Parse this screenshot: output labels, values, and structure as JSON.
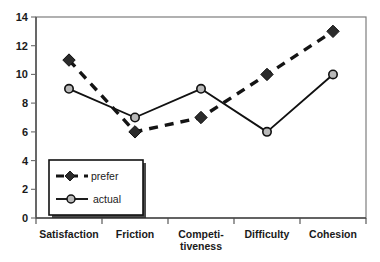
{
  "chart_data": {
    "type": "line",
    "title": "",
    "xlabel": "",
    "ylabel": "",
    "categories": [
      "Satisfaction",
      "Friction",
      "Competi-\ntiveness",
      "Difficulty",
      "Cohesion"
    ],
    "categories_flat": [
      "Satisfaction",
      "Friction",
      "Competitiveness",
      "Difficulty",
      "Cohesion"
    ],
    "series": [
      {
        "name": "prefer",
        "values": [
          11,
          6,
          7,
          10,
          13
        ],
        "style": "dashed",
        "marker": "diamond",
        "color": "#1a1a1a"
      },
      {
        "name": "actual",
        "values": [
          9,
          7,
          9,
          6,
          10
        ],
        "style": "solid",
        "marker": "circle",
        "color": "#1a1a1a"
      }
    ],
    "ylim": [
      0,
      14
    ],
    "yticks": [
      0,
      2,
      4,
      6,
      8,
      10,
      12,
      14
    ],
    "ytick_labels": [
      "0",
      "2",
      "4",
      "6",
      "8",
      "10",
      "12",
      "14"
    ],
    "grid": false,
    "legend_position": "lower-left",
    "frame_color": "#6e6e6e",
    "axis_color": "#555555"
  },
  "legend": {
    "entries": [
      {
        "label": "prefer"
      },
      {
        "label": "actual"
      }
    ]
  }
}
